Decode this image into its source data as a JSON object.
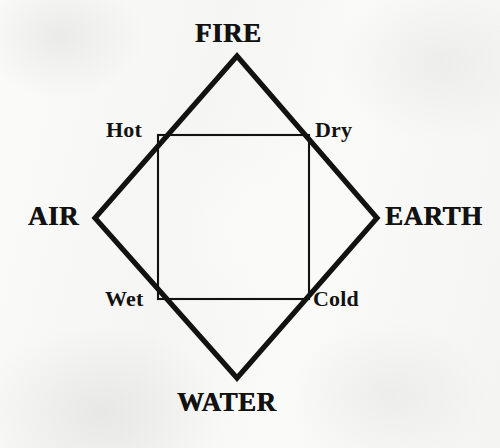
{
  "figure": {
    "background_color": "#f8f8f7",
    "ink_color": "#121210",
    "elements": [
      {
        "key": "fire",
        "label": "FIRE",
        "position": "top"
      },
      {
        "key": "air",
        "label": "AIR",
        "position": "left"
      },
      {
        "key": "earth",
        "label": "EARTH",
        "position": "right"
      },
      {
        "key": "water",
        "label": "WATER",
        "position": "bottom"
      }
    ],
    "qualities": [
      {
        "key": "hot",
        "label": "Hot",
        "position": "top-left"
      },
      {
        "key": "dry",
        "label": "Dry",
        "position": "top-right"
      },
      {
        "key": "wet",
        "label": "Wet",
        "position": "bottom-left"
      },
      {
        "key": "cold",
        "label": "Cold",
        "position": "bottom-right"
      }
    ],
    "shapes": {
      "diamond": {
        "name": "outer-diamond",
        "stroke_width": 5,
        "points": [
          {
            "x": 237,
            "y": 56
          },
          {
            "x": 377,
            "y": 218
          },
          {
            "x": 237,
            "y": 378
          },
          {
            "x": 95,
            "y": 218
          }
        ]
      },
      "square": {
        "name": "inner-square",
        "stroke_width": 2,
        "left": 158,
        "top": 135,
        "right": 309,
        "bottom": 299
      }
    }
  }
}
